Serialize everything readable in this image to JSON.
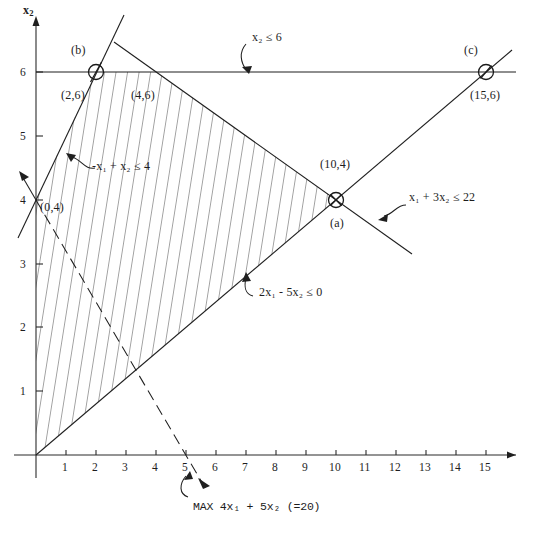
{
  "figure": {
    "axes": {
      "x_label": "x1",
      "y_label": "x2",
      "x_label_display": "x",
      "x_label_sub": "1",
      "y_label_display": "x",
      "y_label_sub": "2",
      "x_ticks": [
        "1",
        "2",
        "3",
        "4",
        "5",
        "6",
        "7",
        "8",
        "9",
        "10",
        "11",
        "12",
        "13",
        "14",
        "15"
      ],
      "x_tick_values": [
        1,
        2,
        3,
        4,
        5,
        6,
        7,
        8,
        9,
        10,
        11,
        12,
        13,
        14,
        15
      ],
      "y_ticks": [
        "1",
        "2",
        "3",
        "4",
        "5",
        "6"
      ],
      "y_tick_values": [
        1,
        2,
        3,
        4,
        5,
        6
      ],
      "xlim": [
        0,
        15.8
      ],
      "ylim": [
        0,
        6.9
      ]
    },
    "vertices": [
      {
        "name": "b",
        "point_label": "(2,6)",
        "marker_label": "(b)",
        "x": 2,
        "y": 6,
        "marker": "circle-slash"
      },
      {
        "name": "corner-4-6",
        "point_label": "(4,6)",
        "marker_label": "",
        "x": 4,
        "y": 6,
        "marker": "none"
      },
      {
        "name": "a",
        "point_label": "(10,4)",
        "marker_label": "(a)",
        "x": 10,
        "y": 4,
        "marker": "circle-cross"
      },
      {
        "name": "c",
        "point_label": "(15,6)",
        "marker_label": "(c)",
        "x": 15,
        "y": 6,
        "marker": "circle-slash"
      },
      {
        "name": "origin-intercept",
        "point_label": "(0,4)",
        "marker_label": "",
        "x": 0,
        "y": 4,
        "marker": "none"
      }
    ],
    "constraints": [
      {
        "id": "c1",
        "label_display": "x₂ ≤ 6",
        "text": "x2 <= 6",
        "lhs_a": "x",
        "lhs_sub": "2",
        "op": "≤",
        "rhs": "6"
      },
      {
        "id": "c2",
        "label_display": "-x₁ + x₂ ≤ 4",
        "text": "-x1 + x2 <= 4"
      },
      {
        "id": "c3",
        "label_display": "x₁ + 3x₂ ≤ 22",
        "text": "x1 + 3x2 <= 22"
      },
      {
        "id": "c4",
        "label_display": "2x₁ - 5x₂ ≤ 0",
        "text": "2x1 - 5x2 <= 0"
      }
    ],
    "objective": {
      "label_display": "MAX 4x₁ + 5x₂ (=20)",
      "text": "MAX 4x1 + 5x2 (=20)",
      "value": "20",
      "style": "dashed"
    },
    "colors": {
      "ink": "#1f1f1f",
      "background": "#ffffff",
      "hatch": "#262626"
    }
  },
  "chart_data": {
    "type": "scatter",
    "title": "",
    "xlabel": "x1",
    "ylabel": "x2",
    "xlim": [
      0,
      15.8
    ],
    "ylim": [
      0,
      6.9
    ],
    "grid": false,
    "legend": "none",
    "lines": [
      {
        "name": "x2 <= 6",
        "equation": "x2 = 6",
        "points": [
          [
            0,
            6
          ],
          [
            15.8,
            6
          ]
        ]
      },
      {
        "name": "-x1 + x2 <= 4",
        "equation": "x2 = x1 + 4",
        "points": [
          [
            -0.6,
            3.4
          ],
          [
            3.1,
            7.1
          ]
        ]
      },
      {
        "name": "x1 + 3x2 <= 22",
        "equation": "x2 = (22 - x1)/3",
        "points": [
          [
            2.6,
            6.5
          ],
          [
            13.5,
            2.85
          ]
        ]
      },
      {
        "name": "2x1 - 5x2 <= 0",
        "equation": "x2 = 0.4 x1",
        "points": [
          [
            0,
            0
          ],
          [
            15.8,
            6.3
          ]
        ]
      },
      {
        "name": "MAX 4x1 + 5x2 (=20)",
        "equation": "4x1 + 5x2 = 20",
        "points": [
          [
            0,
            4
          ],
          [
            5.7,
            -0.56
          ]
        ],
        "style": "dashed"
      }
    ],
    "points": [
      {
        "label": "(2,6)",
        "x": 2,
        "y": 6,
        "annotation": "(b)"
      },
      {
        "label": "(4,6)",
        "x": 4,
        "y": 6,
        "annotation": ""
      },
      {
        "label": "(10,4)",
        "x": 10,
        "y": 4,
        "annotation": "(a)"
      },
      {
        "label": "(15,6)",
        "x": 15,
        "y": 6,
        "annotation": "(c)"
      },
      {
        "label": "(0,4)",
        "x": 0,
        "y": 4,
        "annotation": ""
      }
    ],
    "feasible_region": {
      "hatched": true,
      "vertices": [
        [
          0,
          0
        ],
        [
          0,
          4
        ],
        [
          2,
          6
        ],
        [
          4,
          6
        ],
        [
          10,
          4
        ]
      ]
    },
    "annotations": [
      "x2 <= 6",
      "-x1 + x2 <= 4",
      "x1 + 3x2 <= 22",
      "2x1 - 5x2 <= 0",
      "MAX 4x1 + 5x2 (=20)"
    ]
  }
}
